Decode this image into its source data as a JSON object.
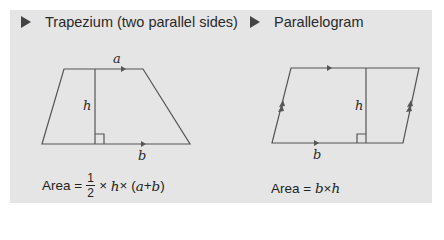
{
  "colors": {
    "panel_bg": "#e5e5e5",
    "line": "#555555",
    "text": "#2a2a2a",
    "bullet": "#444444"
  },
  "left": {
    "title": "Trapezium (two parallel sides)",
    "labels": {
      "top": "a",
      "height": "h",
      "bottom": "b"
    },
    "formula": {
      "prefix": "Area = ",
      "num": "1",
      "den": "2",
      "t1": "× ",
      "h": "h",
      "t2": " × (",
      "a": "a",
      "plus": " + ",
      "b": "b",
      "close": ")"
    }
  },
  "right": {
    "title": "Parallelogram",
    "labels": {
      "height": "h",
      "bottom": "b"
    },
    "formula": {
      "prefix": "Area = ",
      "b": "b",
      "times": " × ",
      "h": "h"
    }
  }
}
